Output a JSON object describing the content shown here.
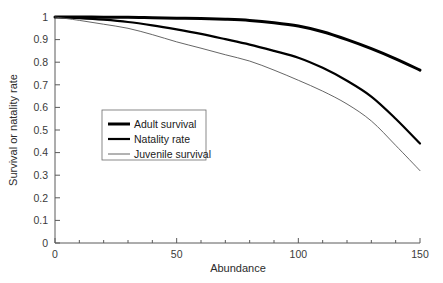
{
  "chart_data": {
    "type": "line",
    "title": "",
    "xlabel": "Abundance",
    "ylabel": "Survival or natality rate",
    "xlim": [
      0,
      150
    ],
    "ylim": [
      0,
      1
    ],
    "grid": false,
    "legend_position": "center-left",
    "xticks": [
      0,
      50,
      100,
      150
    ],
    "xtick_labels": [
      "0",
      "50",
      "100",
      "150"
    ],
    "xminor_step": 10,
    "yticks": [
      0,
      0.1,
      0.2,
      0.3,
      0.4,
      0.5,
      0.6,
      0.7,
      0.8,
      0.9,
      1
    ],
    "ytick_labels": [
      "0",
      "0.1",
      "0.2",
      "0.3",
      "0.4",
      "0.5",
      "0.6",
      "0.7",
      "0.8",
      "0.9",
      "1"
    ],
    "x": [
      0,
      10,
      20,
      30,
      40,
      50,
      60,
      70,
      80,
      90,
      100,
      110,
      120,
      130,
      140,
      150
    ],
    "series": [
      {
        "name": "Adult survival",
        "color": "#000000",
        "line_width": 3.0,
        "values": [
          1.0,
          1.0,
          0.999,
          0.999,
          0.997,
          0.995,
          0.993,
          0.99,
          0.985,
          0.975,
          0.96,
          0.935,
          0.9,
          0.86,
          0.815,
          0.765
        ]
      },
      {
        "name": "Natality rate",
        "color": "#000000",
        "line_width": 2.2,
        "values": [
          1.0,
          0.995,
          0.988,
          0.978,
          0.963,
          0.945,
          0.925,
          0.902,
          0.878,
          0.85,
          0.82,
          0.775,
          0.718,
          0.648,
          0.55,
          0.44
        ]
      },
      {
        "name": "Juvenile survival",
        "color": "#555555",
        "line_width": 0.9,
        "values": [
          1.0,
          0.985,
          0.968,
          0.95,
          0.922,
          0.89,
          0.862,
          0.833,
          0.805,
          0.765,
          0.72,
          0.672,
          0.615,
          0.54,
          0.432,
          0.32
        ]
      }
    ]
  },
  "axes": {
    "x_title": "Abundance",
    "y_title": "Survival or natality rate"
  },
  "legend": {
    "entries": [
      {
        "label": "Adult survival"
      },
      {
        "label": "Natality rate"
      },
      {
        "label": "Juvenile survival"
      }
    ]
  },
  "colors": {
    "axis": "#5a5a5a",
    "curve_dark": "#000000",
    "curve_light": "#555555",
    "legend_border": "#6b6b6b",
    "background": "#ffffff"
  }
}
